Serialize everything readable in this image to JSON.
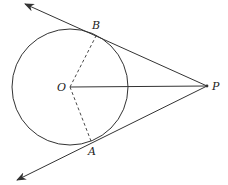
{
  "diagram": {
    "type": "geometry",
    "circle": {
      "center_label": "O",
      "cx": 70,
      "cy": 87,
      "r": 58
    },
    "points": {
      "O": {
        "label": "O",
        "x": 70,
        "y": 87
      },
      "B": {
        "label": "B",
        "x": 97,
        "y": 34
      },
      "A": {
        "label": "A",
        "x": 91,
        "y": 141
      },
      "P": {
        "label": "P",
        "x": 207,
        "y": 86
      }
    },
    "segments": [
      {
        "from": "O",
        "to": "P",
        "style": "solid"
      },
      {
        "from": "O",
        "to": "B",
        "style": "dashed"
      },
      {
        "from": "O",
        "to": "A",
        "style": "dashed"
      }
    ],
    "rays": [
      {
        "from": "P",
        "through": "B",
        "end": {
          "x": 25,
          "y": 4
        },
        "arrow": true
      },
      {
        "from": "P",
        "through": "A",
        "end": {
          "x": 17,
          "y": 180
        },
        "arrow": true
      }
    ],
    "colors": {
      "stroke": "#333333",
      "background": "#ffffff"
    }
  }
}
